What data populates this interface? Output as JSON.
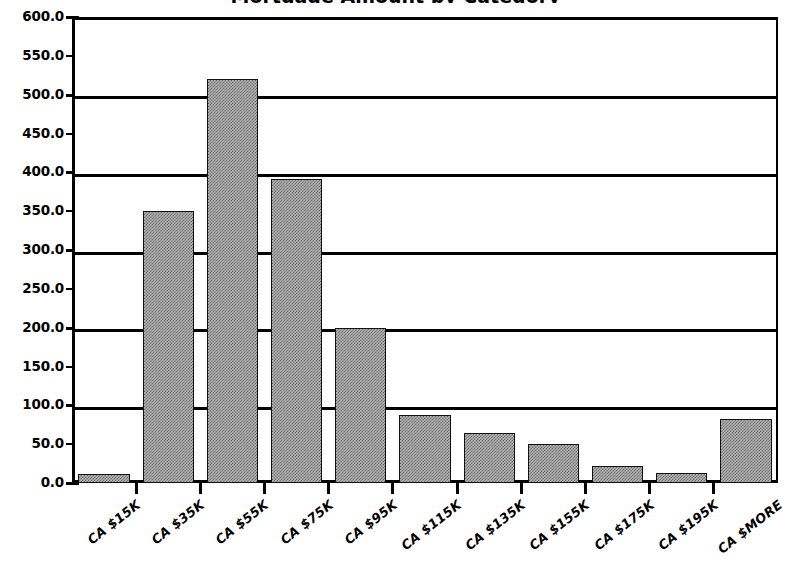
{
  "chart_data": {
    "type": "bar",
    "title": "Mortgage Amount by Category",
    "xlabel": "",
    "ylabel": "",
    "categories": [
      "CA $15K",
      "CA $35K",
      "CA $55K",
      "CA $75K",
      "CA $95K",
      "CA $115K",
      "CA $135K",
      "CA $155K",
      "CA $175K",
      "CA $195K",
      "CA $MORE"
    ],
    "values": [
      11,
      350,
      520,
      392,
      200,
      87,
      65,
      50,
      22,
      13,
      82
    ],
    "ylim": [
      0,
      600
    ],
    "ytick_labels": [
      "600.0",
      "550.0",
      "500.0",
      "450.0",
      "400.0",
      "350.0",
      "300.0",
      "250.0",
      "200.0",
      "150.0",
      "100.0",
      "50.0",
      "0.0"
    ],
    "ytick_values": [
      600,
      550,
      500,
      450,
      400,
      350,
      300,
      250,
      200,
      150,
      100,
      50,
      0
    ],
    "gridline_values": [
      600,
      500,
      400,
      300,
      200,
      100,
      0
    ],
    "grid": true,
    "legend": "none",
    "bar_fill_color": "#b4b4b4",
    "bar_edge_color": "#111111",
    "axis_color": "#000000",
    "background_color": "#ffffff"
  }
}
